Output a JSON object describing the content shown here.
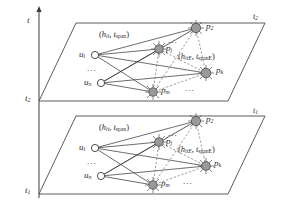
{
  "figure": {
    "type": "layered-temporal-bipartite-graph",
    "colors": {
      "line": "#3c3c3c",
      "plane_edge": "#4a4a4a",
      "node_fill": "#9a9a9a",
      "node_stroke": "#4a4a4a",
      "user_fill": "#ffffff",
      "dashed": "#6e6e6e",
      "text": "#2b2b2b"
    }
  },
  "axis": {
    "name": "time-axis",
    "label": "t",
    "tick_upper": "t",
    "tick_upper_sub": "2",
    "tick_lower": "t",
    "tick_lower_sub": "1"
  },
  "planes": [
    {
      "id": "upper-plane",
      "corner_label": "t",
      "corner_label_sub": "2",
      "axis_tick_label": "t",
      "axis_tick_sub": "2"
    },
    {
      "id": "lower-plane",
      "corner_label": "t",
      "corner_label_sub": "1",
      "axis_tick_label": "t",
      "axis_tick_sub": "1"
    }
  ],
  "edge_labels": {
    "primary": {
      "open": "(",
      "h": "h",
      "h_sub": "it",
      "comma": ", ",
      "t": "t",
      "t_sub": "span",
      "close": ")"
    },
    "secondary": {
      "open": "(",
      "h": "h",
      "h_sub": "itE",
      "comma": ", ",
      "t": "t",
      "t_sub": "spanE",
      "close": ")"
    }
  },
  "nodes": {
    "users": [
      {
        "id": "u-i",
        "label": "u",
        "sub": "i",
        "shape": "open-circle"
      },
      {
        "id": "u-n",
        "label": "u",
        "sub": "n",
        "shape": "open-circle"
      }
    ],
    "user_ellipsis": "...",
    "pages": [
      {
        "id": "p-2",
        "label": "p",
        "sub": "2",
        "shape": "filled-circle-burst"
      },
      {
        "id": "p-j",
        "label": "p",
        "sub": "j",
        "shape": "filled-circle-burst"
      },
      {
        "id": "p-k",
        "label": "p",
        "sub": "k",
        "shape": "filled-circle-burst"
      },
      {
        "id": "p-m",
        "label": "p",
        "sub": "m",
        "shape": "filled-circle-burst"
      }
    ],
    "page_ellipsis_top": "...",
    "page_ellipsis_bottom": "..."
  }
}
